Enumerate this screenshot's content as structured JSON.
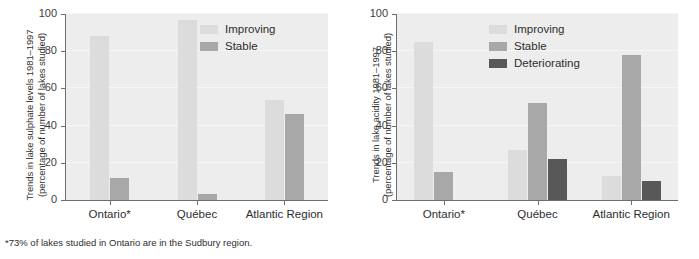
{
  "footnote": "*73% of lakes studied in Ontario are in the Sudbury region.",
  "colors": {
    "improving": "#dcdcdc",
    "stable": "#a8a8a8",
    "deteriorating": "#585858",
    "plot_background": "#ededed",
    "axis": "#6e6e6e",
    "text": "#2e2e2e"
  },
  "chart_data": [
    {
      "type": "bar",
      "title": "",
      "panel_name": "sulphate",
      "ylabel": "Trends in lake sulphate levels 1981–1997 (percentage of number of lakes studied)",
      "ylabel_line1": "Trends in lake sulphate levels 1981–1997",
      "ylabel_line2": "(percentage of number of lakes studied)",
      "xlabel": "",
      "categories": [
        "Ontario*",
        "Québec",
        "Atlantic Region"
      ],
      "ylim": [
        0,
        100
      ],
      "yticks": [
        0,
        20,
        40,
        60,
        80,
        100
      ],
      "grid": true,
      "legend_position": "top-right",
      "series": [
        {
          "name": "Improving",
          "color": "#dcdcdc",
          "values": [
            88,
            97,
            54
          ]
        },
        {
          "name": "Stable",
          "color": "#a8a8a8",
          "values": [
            12,
            3,
            46
          ]
        }
      ]
    },
    {
      "type": "bar",
      "title": "",
      "panel_name": "acidity",
      "ylabel": "Trends in lake acidity 1981–1997 (percentage of number of lakes studied)",
      "ylabel_line1": "Trends in lake acidity 1981–1997",
      "ylabel_line2": "(percentage of number of lakes studied)",
      "xlabel": "",
      "categories": [
        "Ontario*",
        "Québec",
        "Atlantic Region"
      ],
      "ylim": [
        0,
        100
      ],
      "yticks": [
        0,
        20,
        40,
        60,
        80,
        100
      ],
      "grid": true,
      "legend_position": "top-right",
      "series": [
        {
          "name": "Improving",
          "color": "#dcdcdc",
          "values": [
            85,
            27,
            13
          ]
        },
        {
          "name": "Stable",
          "color": "#a8a8a8",
          "values": [
            15,
            52,
            78
          ]
        },
        {
          "name": "Deteriorating",
          "color": "#585858",
          "values": [
            0,
            22,
            10
          ]
        }
      ]
    }
  ]
}
